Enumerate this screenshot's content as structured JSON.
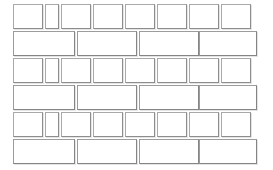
{
  "canvas": {
    "width": 273,
    "height": 170,
    "background_color": "#ffffff",
    "border_color": "#a9a9a9",
    "shadow_color": "#e4e4e4",
    "cell_fill": "#ffffff",
    "pattern_name": "running-bond-brick-grid",
    "row_count": 6,
    "row_height": 25,
    "row_gap": 2
  },
  "rows": [
    {
      "index": 0,
      "type": "narrow",
      "top": 4,
      "cell_count": 8,
      "cells": [
        {
          "label": "",
          "left": 13,
          "width": 30
        },
        {
          "label": "",
          "left": 45,
          "width": 14
        },
        {
          "label": "",
          "left": 61,
          "width": 30
        },
        {
          "label": "",
          "left": 93,
          "width": 30
        },
        {
          "label": "",
          "left": 125,
          "width": 30
        },
        {
          "label": "",
          "left": 157,
          "width": 30
        },
        {
          "label": "",
          "left": 189,
          "width": 30
        },
        {
          "label": "",
          "left": 221,
          "width": 30
        }
      ]
    },
    {
      "index": 1,
      "type": "wide",
      "top": 31,
      "cell_count": 4,
      "cells": [
        {
          "label": "",
          "left": 13,
          "width": 62
        },
        {
          "label": "",
          "left": 77,
          "width": 60
        },
        {
          "label": "",
          "left": 139,
          "width": 60
        },
        {
          "label": "",
          "left": 199,
          "width": 58
        }
      ]
    },
    {
      "index": 2,
      "type": "narrow",
      "top": 58,
      "cell_count": 8,
      "cells": [
        {
          "label": "",
          "left": 13,
          "width": 30
        },
        {
          "label": "",
          "left": 45,
          "width": 14
        },
        {
          "label": "",
          "left": 61,
          "width": 30
        },
        {
          "label": "",
          "left": 93,
          "width": 30
        },
        {
          "label": "",
          "left": 125,
          "width": 30
        },
        {
          "label": "",
          "left": 157,
          "width": 30
        },
        {
          "label": "",
          "left": 189,
          "width": 30
        },
        {
          "label": "",
          "left": 221,
          "width": 30
        }
      ]
    },
    {
      "index": 3,
      "type": "wide",
      "top": 85,
      "cell_count": 4,
      "cells": [
        {
          "label": "",
          "left": 13,
          "width": 62
        },
        {
          "label": "",
          "left": 77,
          "width": 60
        },
        {
          "label": "",
          "left": 139,
          "width": 60
        },
        {
          "label": "",
          "left": 199,
          "width": 58
        }
      ]
    },
    {
      "index": 4,
      "type": "narrow",
      "top": 112,
      "cell_count": 8,
      "cells": [
        {
          "label": "",
          "left": 13,
          "width": 30
        },
        {
          "label": "",
          "left": 45,
          "width": 14
        },
        {
          "label": "",
          "left": 61,
          "width": 30
        },
        {
          "label": "",
          "left": 93,
          "width": 30
        },
        {
          "label": "",
          "left": 125,
          "width": 30
        },
        {
          "label": "",
          "left": 157,
          "width": 30
        },
        {
          "label": "",
          "left": 189,
          "width": 30
        },
        {
          "label": "",
          "left": 221,
          "width": 30
        }
      ]
    },
    {
      "index": 5,
      "type": "wide",
      "top": 139,
      "cell_count": 4,
      "cells": [
        {
          "label": "",
          "left": 13,
          "width": 62
        },
        {
          "label": "",
          "left": 77,
          "width": 60
        },
        {
          "label": "",
          "left": 139,
          "width": 60
        },
        {
          "label": "",
          "left": 199,
          "width": 58
        }
      ]
    }
  ]
}
